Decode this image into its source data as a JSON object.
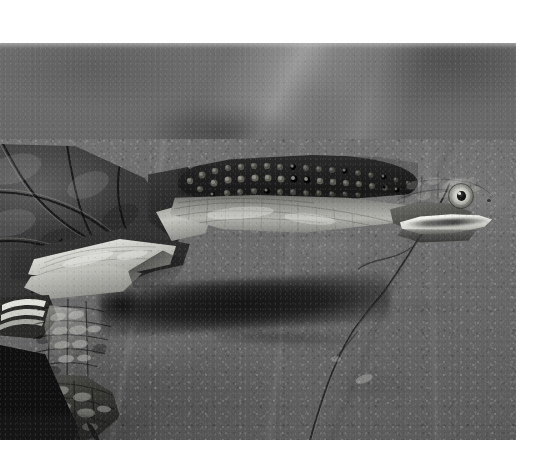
{
  "page": {
    "kind": "photograph",
    "width": 533,
    "height": 470,
    "background_color": "#ffffff",
    "color_mode": "black-and-white"
  },
  "photo": {
    "name": "snake-necked-turtle-photograph",
    "x": 0,
    "y": 43,
    "width": 516,
    "height": 397,
    "alt_text": "Black and white photograph of an eastern long-necked turtle resting on a flat rock with its neck fully extended to the right",
    "border": "white paper margin on top, right and bottom"
  },
  "subject": {
    "common_name": "Eastern snake-necked turtle",
    "pose": "neck fully extended horizontally to the right, body facing left",
    "parts": [
      {
        "name": "carapace",
        "label": "Carapace (shell)",
        "tone": "dark",
        "hex": "#3a3a3a"
      },
      {
        "name": "marginal-scutes",
        "label": "Marginal scutes",
        "tone": "dark-banded",
        "hex": "#2d2d2d"
      },
      {
        "name": "plastron-edge",
        "label": "Plastron bright edge",
        "tone": "highlight",
        "hex": "#f0f0ec"
      },
      {
        "name": "neck",
        "label": "Extended neck with tubercles",
        "tone": "dark-textured",
        "hex": "#242424"
      },
      {
        "name": "neck-underside",
        "label": "Pale neck underside",
        "tone": "light",
        "hex": "#b3b3ae"
      },
      {
        "name": "head",
        "label": "Head",
        "tone": "mid",
        "hex": "#4a4a47"
      },
      {
        "name": "eye",
        "label": "Eye with dark round pupil and pale iris",
        "tone": "contrast",
        "hex": "#0d0d0d"
      },
      {
        "name": "jaw-stripe",
        "label": "Bright white jaw stripe",
        "tone": "highlight",
        "hex": "#ffffff"
      },
      {
        "name": "front-leg",
        "label": "Front leg with overlapping scales",
        "tone": "dark",
        "hex": "#3a3a37"
      },
      {
        "name": "foot",
        "label": "Clawed front foot",
        "tone": "very-dark",
        "hex": "#1c1c1a"
      }
    ]
  },
  "scene": {
    "background_upper": {
      "label": "Out of focus rock background",
      "hex": "#6a6a6a"
    },
    "rock_slab": {
      "label": "Flat sunlit rock slab",
      "hex": "#6b6b6b"
    },
    "rock_crack": {
      "label": "Diagonal crack in rock",
      "hex": "#3c3c3c"
    },
    "cast_shadow": {
      "label": "Cast shadow of the extended neck",
      "hex": "#141414"
    },
    "foreground_wedge": {
      "label": "Dark foreground rock wedge",
      "hex": "#101010"
    },
    "lighting": "hard directional sunlight from upper right"
  }
}
